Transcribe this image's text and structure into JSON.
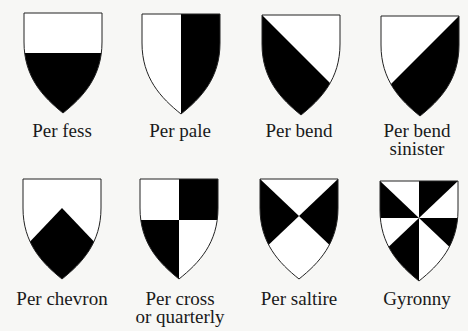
{
  "diagram": {
    "colors": {
      "background": "#f7f7f5",
      "tincture_dark": "#000000",
      "tincture_light": "#ffffff",
      "outline": "#222222"
    },
    "shields": [
      {
        "id": "per-fess",
        "label_lines": [
          "Per fess"
        ],
        "division": "fess"
      },
      {
        "id": "per-pale",
        "label_lines": [
          "Per pale"
        ],
        "division": "pale"
      },
      {
        "id": "per-bend",
        "label_lines": [
          "Per bend"
        ],
        "division": "bend"
      },
      {
        "id": "per-bend-sinister",
        "label_lines": [
          "Per bend",
          "sinister"
        ],
        "division": "bend-sinister"
      },
      {
        "id": "per-chevron",
        "label_lines": [
          "Per chevron"
        ],
        "division": "chevron"
      },
      {
        "id": "per-cross",
        "label_lines": [
          "Per cross",
          "or quarterly"
        ],
        "division": "cross"
      },
      {
        "id": "per-saltire",
        "label_lines": [
          "Per saltire"
        ],
        "division": "saltire"
      },
      {
        "id": "gyronny",
        "label_lines": [
          "Gyronny"
        ],
        "division": "gyronny"
      }
    ]
  }
}
